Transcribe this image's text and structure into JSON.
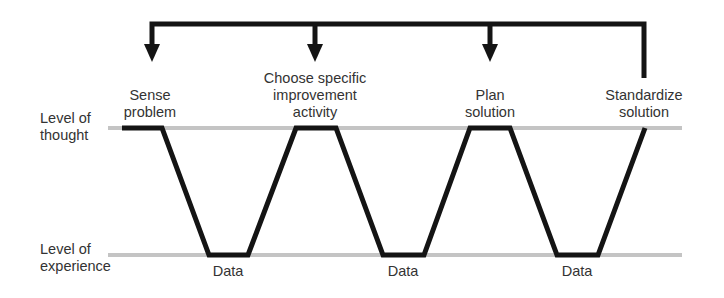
{
  "levels": {
    "thought": "Level of\nthought",
    "experience": "Level of\nexperience"
  },
  "steps": [
    {
      "label": "Sense\nproblem"
    },
    {
      "label": "Choose specific\nimprovement\nactivity"
    },
    {
      "label": "Plan\nsolution"
    },
    {
      "label": "Standardize\nsolution"
    }
  ],
  "data_labels": [
    "Data",
    "Data",
    "Data"
  ],
  "colors": {
    "path": "#141414",
    "level_line": "#bdbdbd",
    "text": "#333333"
  }
}
